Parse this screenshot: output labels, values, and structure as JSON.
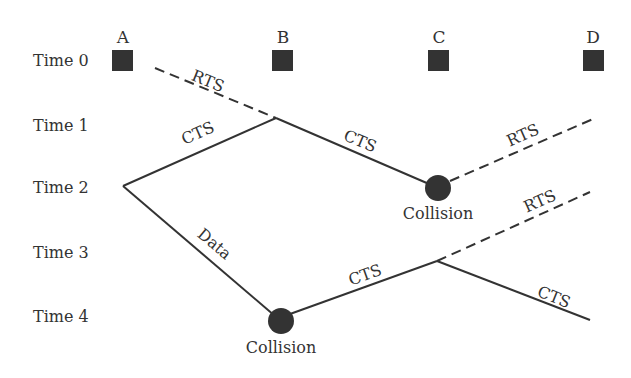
{
  "diagram": {
    "nodes": [
      "A",
      "B",
      "C",
      "D"
    ],
    "time_labels": [
      "Time 0",
      "Time 1",
      "Time 2",
      "Time 3",
      "Time 4"
    ],
    "edges": [
      {
        "label": "RTS",
        "style": "dashed",
        "from": "A",
        "to": "B"
      },
      {
        "label": "CTS",
        "style": "solid",
        "from": "B",
        "to": "A"
      },
      {
        "label": "CTS",
        "style": "solid",
        "from": "B",
        "to": "C"
      },
      {
        "label": "RTS",
        "style": "dashed",
        "from": "C",
        "to": "D"
      },
      {
        "label": "Data",
        "style": "solid",
        "from": "A",
        "to": "B"
      },
      {
        "label": "CTS",
        "style": "solid",
        "from": "B",
        "to": "C"
      },
      {
        "label": "RTS",
        "style": "dashed",
        "from": "C",
        "to": "D"
      },
      {
        "label": "CTS",
        "style": "solid",
        "from": "C",
        "to": "D"
      }
    ],
    "collisions": [
      {
        "label": "Collision",
        "at": "C",
        "time": "Time 2"
      },
      {
        "label": "Collision",
        "at": "B",
        "time": "Time 4"
      }
    ],
    "colors": {
      "ink": "#333333",
      "node_fill": "#333333"
    }
  }
}
